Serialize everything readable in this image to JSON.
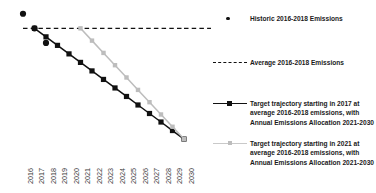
{
  "chart_data": {
    "type": "line",
    "title": "",
    "xlabel": "",
    "ylabel": "",
    "grid": false,
    "legend_position": "right",
    "x": [
      2016,
      2017,
      2018,
      2019,
      2020,
      2021,
      2022,
      2023,
      2024,
      2025,
      2026,
      2027,
      2028,
      2029,
      2030
    ],
    "xtick_labels": [
      "2016",
      "2017",
      "2018",
      "2019",
      "2020",
      "2021",
      "2022",
      "2023",
      "2024",
      "2025",
      "2026",
      "2027",
      "2028",
      "2029",
      "2030"
    ],
    "xlim": [
      2016,
      2030
    ],
    "ylim": [
      0,
      120
    ],
    "series": [
      {
        "name": "Historic 2016-2018 Emissions",
        "type": "scatter",
        "marker": "circle",
        "color": "#111111",
        "x": [
          2016,
          2017,
          2018
        ],
        "values": [
          112,
          100,
          88
        ]
      },
      {
        "name": "Average 2016-2018 Emissions",
        "type": "line",
        "style": "dashed",
        "color": "#111111",
        "x": [
          2016,
          2030
        ],
        "values": [
          100,
          100
        ]
      },
      {
        "name": "Target trajectory starting in 2017 at average 2016-2018 emissions, with Annual Emissions Allocation 2021-2030",
        "type": "line",
        "marker": "square",
        "color": "#111111",
        "x": [
          2017,
          2018,
          2019,
          2020,
          2021,
          2022,
          2023,
          2024,
          2025,
          2026,
          2027,
          2028,
          2029,
          2030
        ],
        "values": [
          100,
          93,
          86,
          79,
          72,
          65,
          58,
          51,
          44,
          37,
          30,
          23,
          16,
          9
        ]
      },
      {
        "name": "Target trajectory starting in 2021 at average 2016-2018 emissions, with Annual Emissions Allocation 2021-2030",
        "type": "line",
        "marker": "square",
        "color": "#bdbdbd",
        "x": [
          2021,
          2022,
          2023,
          2024,
          2025,
          2026,
          2027,
          2028,
          2029,
          2030
        ],
        "values": [
          100,
          89.9,
          79.8,
          69.7,
          59.6,
          49.4,
          39.3,
          29.2,
          19.1,
          9
        ]
      }
    ]
  },
  "legend": {
    "entries": [
      {
        "marker": "circle-marker",
        "label": "Historic 2016-2018 Emissions"
      },
      {
        "marker": "dashed-line-marker",
        "label": "Average 2016-2018 Emissions"
      },
      {
        "marker": "black-square-line-marker",
        "label": "Target trajectory starting in 2017 at average 2016-2018 emissions, with Annual Emissions Allocation 2021-2030"
      },
      {
        "marker": "gray-square-line-marker",
        "label": "Target trajectory starting in 2021 at average 2016-2018 emissions, with Annual Emissions Allocation 2021-2030"
      }
    ]
  },
  "axis": {
    "color": "#d4d4d4"
  }
}
